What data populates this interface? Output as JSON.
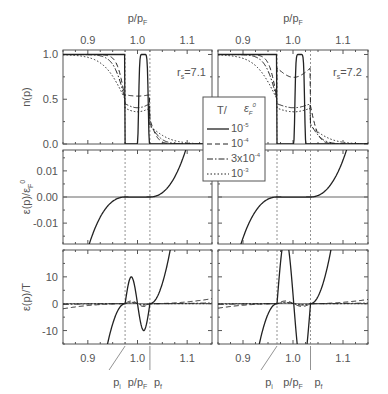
{
  "chart_data": {
    "type": "line",
    "layout": "2 columns x 3 rows of panels, shared x axis p/p_F",
    "top_xlabel": "p/p_F",
    "bottom_xlabel": "p/p_F",
    "xlim": [
      0.85,
      1.15
    ],
    "xticks": [
      0.9,
      1.0,
      1.1
    ],
    "xtick_labels": [
      "0.9",
      "1.0",
      "1.1"
    ],
    "annotations": {
      "pi": "p_i",
      "pf": "p_f"
    },
    "legend": {
      "title": "T/ε_F^0",
      "title_main": "T/",
      "title_eps": "ε",
      "title_sub": "F",
      "title_sup": "0",
      "entries": [
        {
          "style": "solid",
          "label": "10",
          "exp": "-5"
        },
        {
          "style": "dashed",
          "label": "10",
          "exp": "-4"
        },
        {
          "style": "dashdot",
          "label": "3x10",
          "exp": "-4"
        },
        {
          "style": "dotted",
          "label": "10",
          "exp": "-3"
        }
      ]
    },
    "rows": [
      {
        "ylabel": "n(p)",
        "ylim": [
          0.0,
          1.05
        ],
        "yticks": [
          0.0,
          0.5,
          1.0
        ],
        "ytick_labels": [
          "0.0",
          "0.5",
          "1.0"
        ]
      },
      {
        "ylabel": "ε(p)/ε_F^0",
        "ylim": [
          -0.018,
          0.018
        ],
        "yticks": [
          -0.01,
          0.0,
          0.01
        ],
        "ytick_labels": [
          "-0.01",
          "0.00",
          "0.01"
        ]
      },
      {
        "ylabel": "ε(p)/T",
        "ylim": [
          -15,
          20
        ],
        "yticks": [
          -10,
          0,
          10
        ],
        "ytick_labels": [
          "-10",
          "0",
          "10"
        ]
      }
    ],
    "columns": [
      {
        "rs_label": "r",
        "rs_sub": "s",
        "rs_value": "=7.1",
        "p_i": 0.975,
        "p_f": 1.025
      },
      {
        "rs_label": "r",
        "rs_sub": "s",
        "rs_value": "=7.2",
        "p_i": 0.968,
        "p_f": 1.035
      }
    ]
  }
}
